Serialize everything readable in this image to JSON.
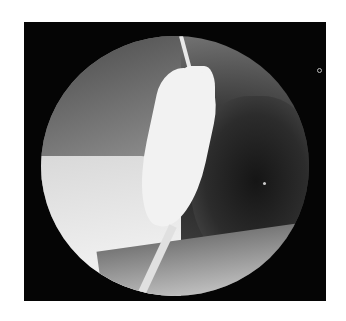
{
  "image": {
    "description": "Circular fluoroscopic barium-swallow radiograph of the distal esophagus on black background",
    "colors": {
      "background": "#ffffff",
      "frame": "#050505",
      "barium": "#f2f2f2"
    }
  }
}
